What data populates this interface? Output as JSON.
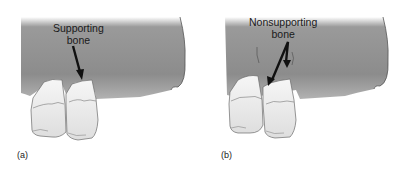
{
  "figure": {
    "panels": [
      {
        "id": "a",
        "label": "(a)",
        "callout_line1": "Supporting",
        "callout_line2": "bone",
        "arrow_count": 1
      },
      {
        "id": "b",
        "label": "(b)",
        "callout_line1": "Nonsupporting",
        "callout_line2": "bone",
        "arrow_count": 2
      }
    ],
    "colors": {
      "bone_top": "#8a8a8a",
      "bone_bottom": "#b9b9b9",
      "bone_edge": "#5a5a5a",
      "tooth_fill": "#ececec",
      "tooth_shadow": "#cfcfcf",
      "tooth_outline": "#6a6a6a",
      "arrow": "#111111",
      "background": "#ffffff"
    }
  }
}
